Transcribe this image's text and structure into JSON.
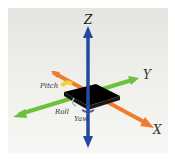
{
  "diagram": {
    "axes": [
      {
        "name": "X",
        "color": "#f07a2e"
      },
      {
        "name": "Y",
        "color": "#6cc13d"
      },
      {
        "name": "Z",
        "color": "#234a9e"
      }
    ],
    "rotations": [
      {
        "name": "Pitch",
        "color": "#f3d23a"
      },
      {
        "name": "Roll",
        "color": "#8fc6c8"
      },
      {
        "name": "Yaw",
        "color": "#6a4fa0"
      }
    ],
    "body_color": "#000000"
  }
}
